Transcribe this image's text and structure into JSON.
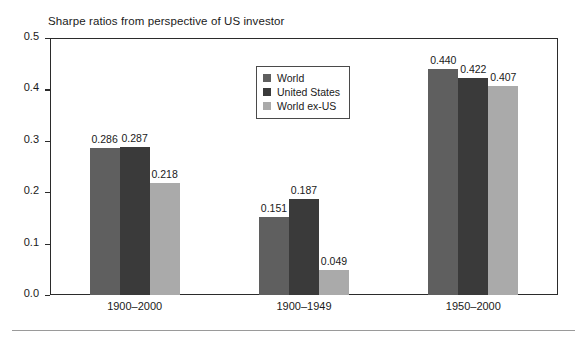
{
  "chart_data": {
    "type": "bar",
    "title": "Sharpe ratios from perspective of US investor",
    "xlabel": "",
    "ylabel": "",
    "ylim": [
      0.0,
      0.5
    ],
    "yticks": [
      "0.0",
      "0.1",
      "0.2",
      "0.3",
      "0.4",
      "0.5"
    ],
    "ytick_values": [
      0.0,
      0.1,
      0.2,
      0.3,
      0.4,
      0.5
    ],
    "grid": false,
    "legend_position": "upper center",
    "categories": [
      "1900–2000",
      "1900–1949",
      "1950–2000"
    ],
    "series": [
      {
        "name": "World",
        "color": "#5f5f5f",
        "values": [
          0.286,
          0.151,
          0.44
        ],
        "labels": [
          "0.286",
          "0.151",
          "0.440"
        ]
      },
      {
        "name": "United States",
        "color": "#3a3a3a",
        "values": [
          0.287,
          0.187,
          0.422
        ],
        "labels": [
          "0.287",
          "0.187",
          "0.422"
        ]
      },
      {
        "name": "World ex-US",
        "color": "#aaaaaa",
        "values": [
          0.218,
          0.049,
          0.407
        ],
        "labels": [
          "0.218",
          "0.049",
          "0.407"
        ]
      }
    ]
  },
  "colors": {
    "world": "#5f5f5f",
    "united_states": "#3a3a3a",
    "world_ex_us": "#aaaaaa",
    "axis": "#2b2b2b",
    "text": "#1a1a1a",
    "background": "#ffffff",
    "rule": "#9a9a9a"
  }
}
